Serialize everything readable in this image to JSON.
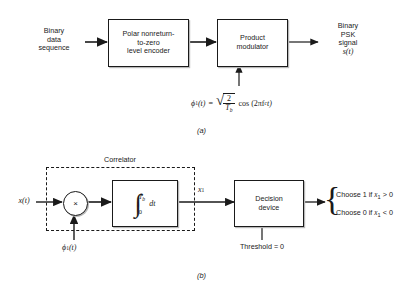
{
  "figure": {
    "caption_a": "(a)",
    "caption_b": "(b)"
  },
  "diagram_a": {
    "title": "Binary PSK transmitter",
    "input_label": "Binary\ndata\nsequence",
    "block_encoder": "Polar nonreturn-\nto-zero\nlevel encoder",
    "block_modulator": "Product\nmodulator",
    "output_label": "Binary\nPSK\nsignal",
    "output_signal_symbol": "s(t)",
    "carrier_formula": {
      "lhs": "ϕ",
      "lhs_sub": "1",
      "lhs_arg": "(t)",
      "equals": "=",
      "sqrt_numerator": "2",
      "sqrt_denominator": "T",
      "sqrt_denominator_sub": "b",
      "cos_expression": "cos (2πf",
      "cos_sub": "c",
      "cos_tail": "t)",
      "plain": "ϕ₁(t) = √(2/T_b) cos (2πf_c t)"
    }
  },
  "diagram_b": {
    "title": "Binary PSK receiver",
    "input_symbol": "x(t)",
    "correlator_label": "Correlator",
    "multiplier_symbol": "×",
    "local_carrier_symbol": "ϕ",
    "local_carrier_sub": "1",
    "local_carrier_arg": "(t)",
    "integrator": {
      "integral_sign": "∫",
      "upper_limit": "T",
      "upper_limit_sub": "b",
      "lower_limit": "0",
      "differential": "dt",
      "plain": "∫₀^{T_b} dt"
    },
    "signal_out_symbol": "x",
    "signal_out_sub": "1",
    "block_decision": "Decision\ndevice",
    "threshold_label": "Threshold = 0",
    "decision_rules": [
      "Choose 1 if x₁ > 0",
      "Choose 0 if x₁ < 0"
    ],
    "decision_rule_parts": [
      {
        "prefix": "Choose 1 if ",
        "var": "x",
        "sub": "1",
        "cmp": " > 0"
      },
      {
        "prefix": "Choose 0 if ",
        "var": "x",
        "sub": "1",
        "cmp": " < 0"
      }
    ]
  },
  "colors": {
    "stroke": "#1a1a1a",
    "background": "#ffffff",
    "shadow": "#b9b9b9"
  }
}
